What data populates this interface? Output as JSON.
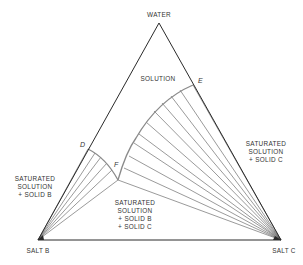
{
  "diagram": {
    "type": "ternary phase diagram",
    "vertices": {
      "top": "WATER",
      "left": "SALT B",
      "right": "SALT C"
    },
    "points": {
      "D": "D",
      "E": "E",
      "F": "F"
    },
    "regions": {
      "solution": "SOLUTION",
      "sat_b": [
        "SATURATED",
        "SOLUTION",
        "+ SOLID B"
      ],
      "sat_c": [
        "SATURATED",
        "SOLUTION",
        "+ SOLID C"
      ],
      "sat_bc": [
        "SATURATED",
        "SOLUTION",
        "+ SOLID B",
        "+ SOLID C"
      ]
    },
    "colors": {
      "edge": "#2a2a2a",
      "curve": "#8a8a8a",
      "text": "#333333"
    }
  }
}
